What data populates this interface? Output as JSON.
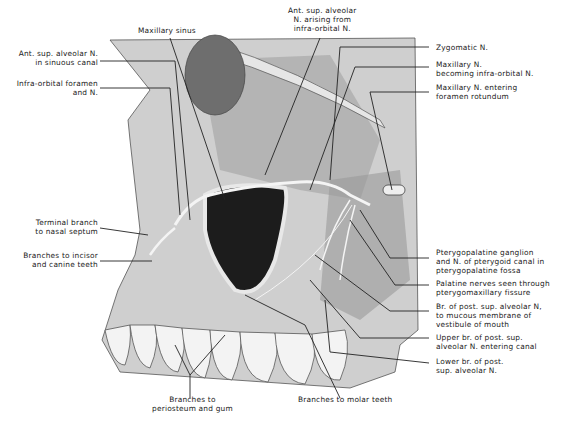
{
  "figure": {
    "labels": {
      "maxillary_sinus": "Maxillary sinus",
      "ant_sup_alveolar_arising": "Ant. sup. alveolar\nN. arising from\ninfra-orbital N.",
      "ant_sup_alveolar_canal": "Ant. sup. alveolar N.\nin sinuous canal",
      "infraorbital_foramen": "Infra-orbital foramen\nand N.",
      "terminal_branch": "Terminal branch\nto nasal septum",
      "incisor_canine": "Branches to incisor\nand canine teeth",
      "zygomatic": "Zygomatic N.",
      "maxillary_becoming": "Maxillary N.\nbecoming infra-orbital N.",
      "maxillary_entering": "Maxillary N. entering\nforamen rotundum",
      "pterygopalatine_ganglion": "Pterygopalatine ganglion\nand N. of pterygoid canal in\npterygopalatine fossa",
      "palatine_nerves": "Palatine nerves seen through\npterygomaxillary fissure",
      "br_mucous": "Br. of post. sup. alveolar N,\nto mucous membrane of\nvestibule of mouth",
      "upper_br": "Upper br. of post. sup.\nalveolar N. entering canal",
      "lower_br": "Lower br. of post.\nsup. alveolar N.",
      "periosteum_gum": "Branches to\nperiosteum and gum",
      "molar_teeth": "Branches to molar teeth"
    }
  }
}
